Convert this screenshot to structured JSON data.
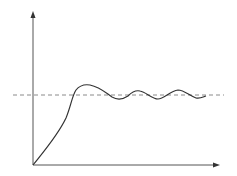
{
  "diagram": {
    "type": "step-response",
    "colors": {
      "axis": "#555555",
      "curve": "#333333",
      "setpoint": "#888888",
      "background": "#ffffff"
    },
    "axes": {
      "origin": [
        33,
        165
      ],
      "y_axis_end": [
        33,
        12
      ],
      "x_axis_end": [
        219,
        165
      ]
    },
    "setpoint_line": {
      "y": 95,
      "x_start": 13,
      "x_end": 224,
      "style": "dashed"
    },
    "curve_points": [
      [
        33,
        165
      ],
      [
        50,
        145
      ],
      [
        63,
        122
      ],
      [
        72,
        96
      ],
      [
        78,
        87
      ],
      [
        86,
        85
      ],
      [
        96,
        87
      ],
      [
        108,
        94
      ],
      [
        118,
        99
      ],
      [
        128,
        97
      ],
      [
        138,
        90
      ],
      [
        148,
        92
      ],
      [
        158,
        99
      ],
      [
        168,
        96
      ],
      [
        178,
        90
      ],
      [
        190,
        93
      ],
      [
        198,
        98
      ],
      [
        205,
        96
      ]
    ]
  }
}
